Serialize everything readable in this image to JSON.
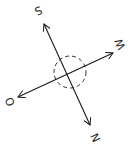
{
  "diagram": {
    "type": "compass-rose-sketch",
    "stroke_color": "#1a1a1a",
    "background": "#ffffff",
    "labels": {
      "top": "S",
      "right": "W",
      "left": "O",
      "bottom": "N"
    },
    "axes": [
      {
        "name": "S-N axis",
        "from": [
          44,
          24
        ],
        "to": [
          90,
          125
        ],
        "arrow_both": true
      },
      {
        "name": "W-O axis",
        "from": [
          113,
          53
        ],
        "to": [
          18,
          97
        ],
        "arrow_both": true
      }
    ],
    "center_circle": {
      "cx": 70,
      "cy": 72,
      "r": 16,
      "style": "dashed"
    }
  }
}
